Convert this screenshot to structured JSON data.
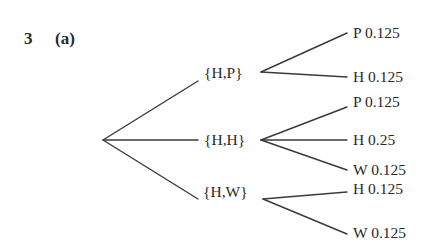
{
  "question": {
    "number": "3",
    "part": "(a)"
  },
  "tree": {
    "root": "",
    "first_level": [
      {
        "label": "{H,P}",
        "children": [
          {
            "label": "P 0.125"
          },
          {
            "label": "H 0.125"
          }
        ]
      },
      {
        "label": "{H,H}",
        "children": [
          {
            "label": "P 0.125"
          },
          {
            "label": "H 0.25"
          },
          {
            "label": "W 0.125"
          }
        ]
      },
      {
        "label": "{H,W}",
        "children": [
          {
            "label": "H 0.125"
          },
          {
            "label": "W 0.125"
          }
        ]
      }
    ]
  },
  "colors": {
    "line": "#3a3a3a",
    "text": "#2a2a2a",
    "background": "#ffffff"
  }
}
